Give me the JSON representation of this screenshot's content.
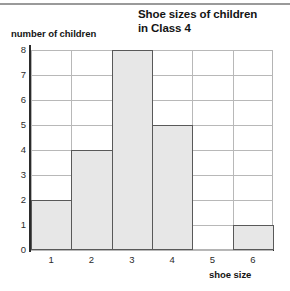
{
  "chart_data": {
    "type": "bar",
    "title": "Shoe sizes of children in Class 4",
    "title_lines": [
      "Shoe sizes of children",
      "in Class 4"
    ],
    "xlabel": "shoe size",
    "ylabel": "number of children",
    "categories": [
      "1",
      "2",
      "3",
      "4",
      "5",
      "6"
    ],
    "values": [
      2,
      4,
      8,
      5,
      0,
      1
    ],
    "ylim": [
      0,
      8
    ],
    "y_ticks": [
      "0",
      "1",
      "2",
      "3",
      "4",
      "5",
      "6",
      "7",
      "8"
    ],
    "grid": true,
    "legend": null,
    "colors": {
      "bar_fill": "#e7e7e7",
      "bar_edge": "#595959",
      "gridline": "#b8b8b8",
      "axis": "#2b2b2b",
      "text": "#141414",
      "background": "#ffffff"
    }
  }
}
